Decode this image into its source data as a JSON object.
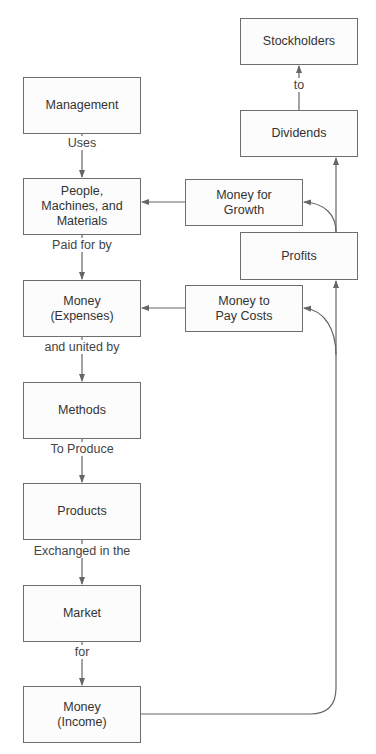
{
  "diagram": {
    "boxes": [
      {
        "id": "management",
        "label": "Management",
        "x": 23,
        "y": 77,
        "w": 118,
        "h": 57
      },
      {
        "id": "people",
        "label": "People,\nMachines, and\nMaterials",
        "x": 23,
        "y": 178,
        "w": 118,
        "h": 57
      },
      {
        "id": "expenses",
        "label": "Money\n(Expenses)",
        "x": 23,
        "y": 280,
        "w": 118,
        "h": 57
      },
      {
        "id": "methods",
        "label": "Methods",
        "x": 23,
        "y": 382,
        "w": 118,
        "h": 57
      },
      {
        "id": "products",
        "label": "Products",
        "x": 23,
        "y": 483,
        "w": 118,
        "h": 57
      },
      {
        "id": "market",
        "label": "Market",
        "x": 23,
        "y": 585,
        "w": 118,
        "h": 57
      },
      {
        "id": "income",
        "label": "Money\n(Income)",
        "x": 23,
        "y": 686,
        "w": 118,
        "h": 57
      },
      {
        "id": "stockholders",
        "label": "Stockholders",
        "x": 240,
        "y": 18,
        "w": 118,
        "h": 47
      },
      {
        "id": "dividends",
        "label": "Dividends",
        "x": 240,
        "y": 110,
        "w": 118,
        "h": 47
      },
      {
        "id": "growth",
        "label": "Money for\nGrowth",
        "x": 185,
        "y": 179,
        "w": 118,
        "h": 47
      },
      {
        "id": "profits",
        "label": "Profits",
        "x": 240,
        "y": 232,
        "w": 118,
        "h": 48
      },
      {
        "id": "paycosts",
        "label": "Money to\nPay Costs",
        "x": 185,
        "y": 285,
        "w": 118,
        "h": 47
      }
    ],
    "edge_labels": [
      {
        "id": "uses",
        "text": "Uses",
        "x": 82,
        "y": 143
      },
      {
        "id": "paid-for-by",
        "text": "Paid for by",
        "x": 82,
        "y": 245
      },
      {
        "id": "and-united-by",
        "text": "and united by",
        "x": 82,
        "y": 347
      },
      {
        "id": "to-produce",
        "text": "To Produce",
        "x": 82,
        "y": 449
      },
      {
        "id": "exchanged-in-the",
        "text": "Exchanged in the",
        "x": 82,
        "y": 551
      },
      {
        "id": "for",
        "text": "for",
        "x": 82,
        "y": 652
      },
      {
        "id": "to",
        "text": "to",
        "x": 299,
        "y": 85
      }
    ],
    "colors": {
      "line": "#666666",
      "border": "#6e6e6e",
      "text": "#333333"
    }
  }
}
